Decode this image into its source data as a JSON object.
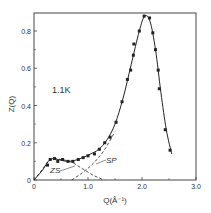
{
  "chart_data": {
    "type": "scatter",
    "title": "",
    "annotation": "1.1K",
    "xlabel": "Q(Å⁻¹)",
    "ylabel": "Z(Q)",
    "xlim": [
      0,
      3.0
    ],
    "ylim": [
      0,
      0.9
    ],
    "xticks": [
      "0",
      "1.0",
      "2.0",
      "3.0"
    ],
    "yticks": [
      "0",
      "0.2",
      "0.4",
      "0.6",
      "0.8"
    ],
    "grid": false,
    "legend": null,
    "curve_labels": [
      "ZS",
      "SP"
    ],
    "series": [
      {
        "name": "measured",
        "style": "points",
        "x": [
          0.25,
          0.3,
          0.38,
          0.44,
          0.53,
          0.63,
          0.72,
          0.82,
          0.91,
          1.0,
          1.12,
          1.21,
          1.31,
          1.41,
          1.52,
          1.63,
          1.73,
          1.79,
          1.84,
          1.85,
          1.95,
          2.04,
          2.14,
          2.2,
          2.25,
          2.3,
          2.32,
          2.43,
          2.52
        ],
        "y": [
          0.08,
          0.11,
          0.115,
          0.1,
          0.11,
          0.1,
          0.1,
          0.11,
          0.12,
          0.13,
          0.14,
          0.165,
          0.2,
          0.23,
          0.31,
          0.42,
          0.54,
          0.59,
          0.67,
          0.73,
          0.8,
          0.88,
          0.87,
          0.79,
          0.7,
          0.59,
          0.49,
          0.27,
          0.16
        ]
      },
      {
        "name": "fit",
        "style": "solid",
        "x": [
          0.0,
          0.15,
          0.3,
          0.45,
          0.6,
          0.75,
          0.9,
          1.05,
          1.2,
          1.35,
          1.5,
          1.65,
          1.8,
          1.95,
          2.05,
          2.15,
          2.25,
          2.35,
          2.45,
          2.55
        ],
        "y": [
          0.0,
          0.05,
          0.11,
          0.11,
          0.1,
          0.105,
          0.12,
          0.14,
          0.165,
          0.215,
          0.3,
          0.44,
          0.62,
          0.8,
          0.88,
          0.85,
          0.7,
          0.47,
          0.27,
          0.14
        ]
      },
      {
        "name": "ZS",
        "style": "dashed",
        "x": [
          0.0,
          0.15,
          0.3,
          0.5,
          0.7,
          0.9,
          1.1,
          1.3
        ],
        "y": [
          0.0,
          0.055,
          0.11,
          0.11,
          0.095,
          0.06,
          0.025,
          0.0
        ]
      },
      {
        "name": "SP",
        "style": "dashed",
        "x": [
          0.7,
          0.9,
          1.1,
          1.3,
          1.5
        ],
        "y": [
          0.0,
          0.04,
          0.09,
          0.16,
          0.26
        ]
      }
    ]
  }
}
